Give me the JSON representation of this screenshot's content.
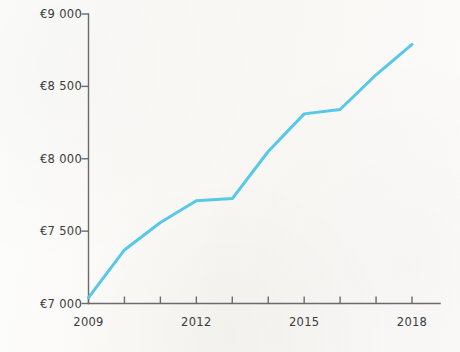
{
  "chart_data": {
    "type": "line",
    "title": "",
    "subtitle": "",
    "xlabel": "",
    "ylabel": "",
    "x": [
      2009,
      2010,
      2011,
      2012,
      2013,
      2014,
      2015,
      2016,
      2017,
      2018
    ],
    "categories": [
      "2009",
      "2010",
      "2011",
      "2012",
      "2013",
      "2014",
      "2015",
      "2016",
      "2017",
      "2018"
    ],
    "series": [
      {
        "name": "",
        "color": "#58c8e8",
        "values": [
          7040,
          7370,
          7560,
          7710,
          7725,
          8050,
          8310,
          8340,
          8580,
          8790
        ]
      }
    ],
    "xlim": [
      2009,
      2018
    ],
    "ylim": [
      7000,
      9000
    ],
    "ytick_values": [
      7000,
      7500,
      8000,
      8500,
      9000
    ],
    "ytick_labels": [
      "€7 000",
      "€7 500",
      "€8 000",
      "€8 500",
      "€9 000"
    ],
    "xtick_values": [
      2009,
      2010,
      2011,
      2012,
      2013,
      2014,
      2015,
      2016,
      2017,
      2018
    ],
    "xtick_labels_shown": [
      "2009",
      "2012",
      "2015",
      "2018"
    ],
    "xtick_labeled_values": [
      2009,
      2012,
      2015,
      2018
    ],
    "grid": false,
    "legend": false,
    "legend_position": "none",
    "markers": false,
    "line_width": 3,
    "currency_symbol": "€",
    "axis_color": "#6b6b6b",
    "text_color": "#3c3c3c",
    "background_color": "#fbfaf8",
    "annotations": []
  }
}
